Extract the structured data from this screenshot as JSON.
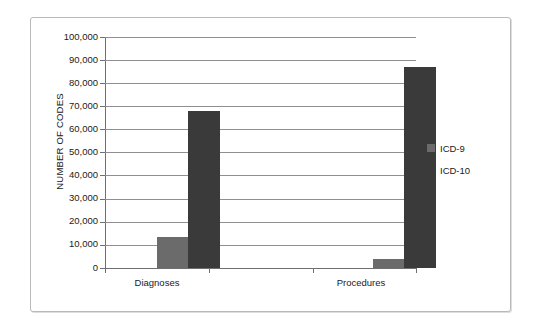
{
  "chart_data": {
    "type": "bar",
    "title": "",
    "subtitle": "",
    "xlabel": "",
    "ylabel": "NUMBER OF CODES",
    "categories": [
      "Diagnoses",
      "Procedures"
    ],
    "series": [
      {
        "name": "ICD-9",
        "color": "#6b6b6b",
        "values": [
          13500,
          4000
        ]
      },
      {
        "name": "ICD-10",
        "color": "#3a3a3a",
        "values": [
          68000,
          87000
        ]
      }
    ],
    "ylim": [
      0,
      100000
    ],
    "ytick_step": 10000,
    "ytick_labels": [
      "100,000",
      "90,000",
      "80,000",
      "70,000",
      "60,000",
      "50,000",
      "40,000",
      "30,000",
      "20,000",
      "10,000",
      "0"
    ],
    "ytick_values": [
      100000,
      90000,
      80000,
      70000,
      60000,
      50000,
      40000,
      30000,
      20000,
      10000,
      0
    ],
    "grid": true,
    "grid_axis": "y",
    "legend": [
      "ICD-9",
      "ICD-10"
    ],
    "legend_position": "right"
  }
}
